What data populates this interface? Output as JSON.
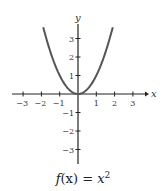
{
  "chart_data": {
    "type": "line",
    "caption": {
      "prefix": "f",
      "arg": "(x)",
      "equals": " = ",
      "base": "x",
      "exponent": "2"
    },
    "xlabel": "x",
    "ylabel": "y",
    "xlim": [
      -3.6,
      3.6
    ],
    "ylim": [
      -3.7,
      3.8
    ],
    "xticks": [
      -3,
      -2,
      -1,
      1,
      2,
      3
    ],
    "yticks": [
      -3,
      -2,
      -1,
      1,
      2,
      3
    ],
    "grid": false,
    "series": [
      {
        "name": "f(x) = x^2",
        "x": [
          -1.9,
          -1.5,
          -1,
          -0.5,
          0,
          0.5,
          1,
          1.5,
          1.9
        ],
        "y": [
          3.61,
          2.25,
          1,
          0.25,
          0,
          0.25,
          1,
          2.25,
          3.61
        ],
        "color": "#555555"
      }
    ],
    "axis_color": "#222222"
  }
}
